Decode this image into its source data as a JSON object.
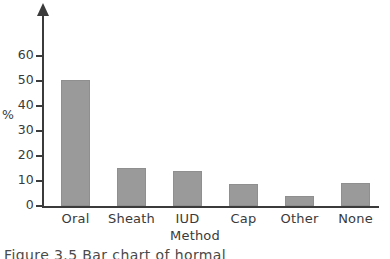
{
  "chart_data": {
    "type": "bar",
    "title": "",
    "subtitle": "",
    "xlabel": "Method",
    "ylabel": "%",
    "categories": [
      "Oral",
      "Sheath",
      "IUD",
      "Cap",
      "Other",
      "None"
    ],
    "values": [
      50.5,
      15.2,
      14.0,
      8.7,
      3.9,
      9.4
    ],
    "ylim": [
      0,
      65
    ],
    "yticks": [
      0,
      10,
      20,
      30,
      40,
      50,
      60
    ],
    "ytick_labels": [
      "0",
      "10",
      "20",
      "30",
      "40",
      "50",
      "60"
    ],
    "grid": false,
    "legend": null,
    "bar_color": "#9a9a9a",
    "axis_color": "#3b3b3b",
    "background": "#ffffff",
    "y_axis_arrow": true
  },
  "caption": {
    "text": "Figure 3.5   Bar chart of hormal"
  }
}
